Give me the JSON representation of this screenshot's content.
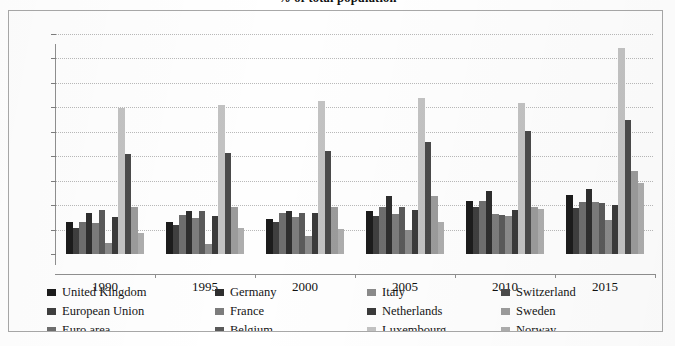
{
  "chart_data": {
    "type": "bar",
    "title": "% of total population",
    "title_note": "title is cropped at the top edge of the screenshot",
    "xlabel": "",
    "ylabel": "",
    "ylim": [
      0,
      45
    ],
    "ytick_step": 5,
    "yticks": [
      "45",
      "40",
      "35",
      "30",
      "25",
      "20",
      "15",
      "10",
      "5",
      "0"
    ],
    "grid": true,
    "legend_position": "bottom",
    "categories": [
      "1990",
      "1995",
      "2000",
      "2005",
      "2010",
      "2015"
    ],
    "series": [
      {
        "name": "United Kingdom",
        "color": "#1c1c1c",
        "values": [
          6.6,
          6.6,
          7.1,
          8.8,
          10.9,
          12.0
        ]
      },
      {
        "name": "European Union",
        "color": "#3f3f3f",
        "values": [
          5.4,
          6.0,
          6.6,
          7.7,
          9.6,
          9.5
        ]
      },
      {
        "name": "Euro area",
        "color": "#6e6e6e",
        "values": [
          6.5,
          8.0,
          8.4,
          9.6,
          10.9,
          10.7
        ]
      },
      {
        "name": "Germany",
        "color": "#2e2e2e",
        "values": [
          8.4,
          8.8,
          8.9,
          11.8,
          12.8,
          13.3
        ]
      },
      {
        "name": "France",
        "color": "#7c7c7c",
        "values": [
          6.3,
          7.4,
          7.6,
          8.2,
          8.1,
          10.6
        ]
      },
      {
        "name": "Belgium",
        "color": "#5a5a5a",
        "values": [
          9.0,
          8.9,
          8.4,
          9.6,
          8.0,
          10.4
        ]
      },
      {
        "name": "Italy",
        "color": "#8a8a8a",
        "values": [
          2.3,
          2.0,
          3.6,
          4.9,
          7.8,
          7.0
        ]
      },
      {
        "name": "Netherlands",
        "color": "#3a3a3a",
        "values": [
          7.6,
          7.8,
          8.4,
          9.1,
          9.1,
          10.1
        ]
      },
      {
        "name": "Luxembourg",
        "color": "#c2c2c2",
        "values": [
          29.8,
          30.4,
          31.3,
          32.0,
          30.9,
          42.1
        ]
      },
      {
        "name": "Switzerland",
        "color": "#4a4a4a",
        "values": [
          20.4,
          20.6,
          21.0,
          23.0,
          25.1,
          27.5
        ]
      },
      {
        "name": "Sweden",
        "color": "#9b9b9b",
        "values": [
          9.7,
          9.7,
          9.7,
          11.8,
          9.6,
          17.0
        ]
      },
      {
        "name": "Norway",
        "color": "#adadad",
        "values": [
          4.2,
          5.3,
          5.1,
          6.6,
          9.3,
          14.5
        ]
      }
    ]
  },
  "legend": {
    "items": [
      {
        "label": "United Kingdom",
        "color": "#1c1c1c"
      },
      {
        "label": "European Union",
        "color": "#3f3f3f"
      },
      {
        "label": "Euro area",
        "color": "#6e6e6e"
      },
      {
        "label": "Germany",
        "color": "#2e2e2e"
      },
      {
        "label": "France",
        "color": "#7c7c7c"
      },
      {
        "label": "Belgium",
        "color": "#5a5a5a"
      },
      {
        "label": "Italy",
        "color": "#8a8a8a"
      },
      {
        "label": "Netherlands",
        "color": "#3a3a3a"
      },
      {
        "label": "Luxembourg",
        "color": "#c2c2c2"
      },
      {
        "label": "Switzerland",
        "color": "#4a4a4a"
      },
      {
        "label": "Sweden",
        "color": "#9b9b9b"
      },
      {
        "label": "Norway",
        "color": "#adadad"
      }
    ]
  }
}
